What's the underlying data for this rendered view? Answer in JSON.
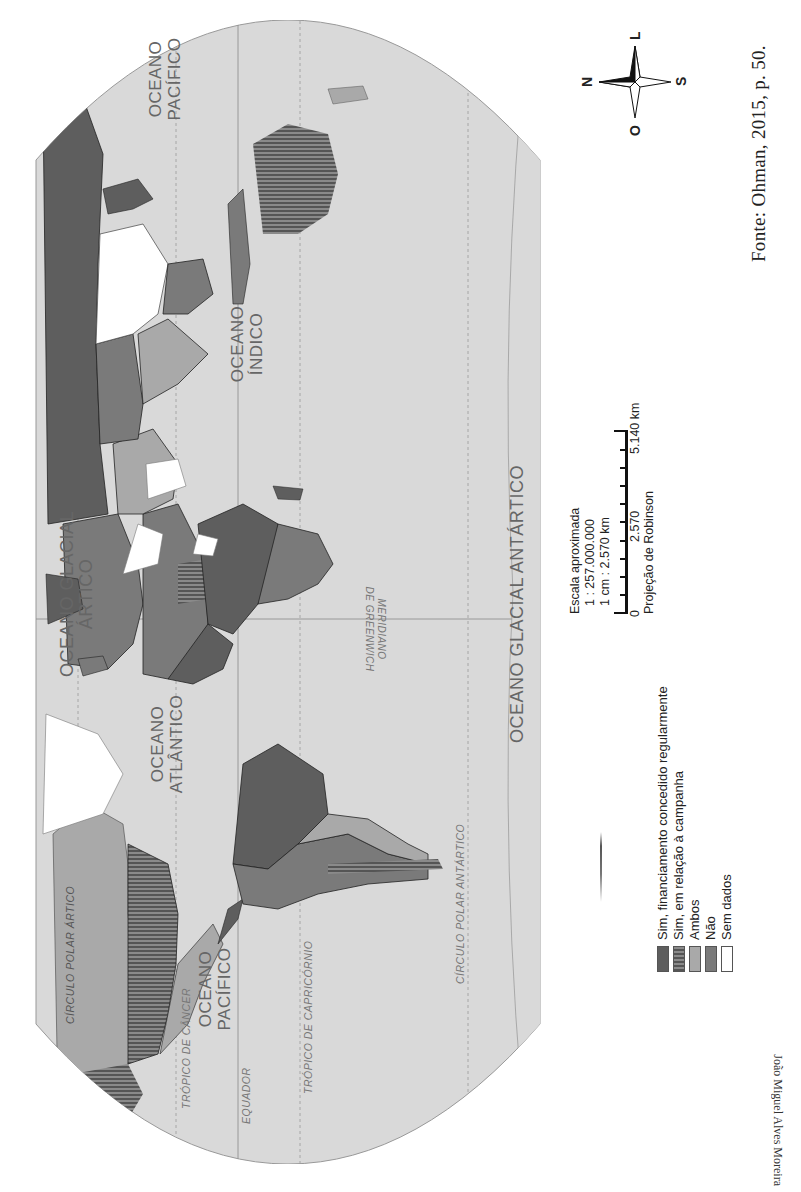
{
  "map": {
    "title": "Financiamento público direto a partidos políticos",
    "projection": "Projeção de Robinson",
    "oceans": {
      "arctic": "OCEANO GLACIAL ÁRTICO",
      "atlantic_1": "OCEANO",
      "atlantic_2": "ATLÂNTICO",
      "pacific_west_1": "OCEANO",
      "pacific_west_2": "PACÍFICO",
      "pacific_east_1": "OCEANO",
      "pacific_east_2": "PACÍFICO",
      "indian_1": "OCEANO",
      "indian_2": "ÍNDICO",
      "antarctic": "OCEANO GLACIAL ANTÁRTICO"
    },
    "lines": {
      "tropic_cancer": "TRÓPICO DE CÂNCER",
      "equator": "EQUADOR",
      "tropic_capricorn": "TRÓPICO DE CAPRICÓRNIO",
      "antarctic_circle": "CÍRCULO POLAR ANTÁRTICO",
      "arctic_circle": "CÍRCULO POLAR ÁRTICO",
      "meridian_1": "MERIDIANO",
      "meridian_2": "DE GREENWICH"
    }
  },
  "legend": {
    "items": [
      {
        "label": "Sim, financiamento concedido regularmente",
        "color": "#5e5e5e",
        "pattern": "solid"
      },
      {
        "label": "Sim, em relação à campanha",
        "color": "#6f6f6f",
        "pattern": "vertical-stripes"
      },
      {
        "label": "Ambos",
        "color": "#a9a9a9",
        "pattern": "solid"
      },
      {
        "label": "Não",
        "color": "#7a7a7a",
        "pattern": "solid"
      },
      {
        "label": "Sem dados",
        "color": "#ffffff",
        "pattern": "solid"
      }
    ]
  },
  "scale": {
    "title": "Escala aproximada",
    "ratio": "1 : 257.000.000",
    "cm": "1 cm : 2.570 km",
    "ticks": [
      "0",
      "2.570",
      "5.140 km"
    ]
  },
  "compass": {
    "north": "N",
    "south": "S",
    "east": "L",
    "west": "O"
  },
  "source": "Fonte: Ohman, 2015, p. 50.",
  "author_credit": "João Miguel Alves Moreira",
  "colors": {
    "ocean": "#d9d9d9",
    "land_regular": "#5e5e5e",
    "land_campaign": "#6f6f6f",
    "land_both": "#a9a9a9",
    "land_no": "#7a7a7a",
    "land_no_data": "#ffffff"
  }
}
